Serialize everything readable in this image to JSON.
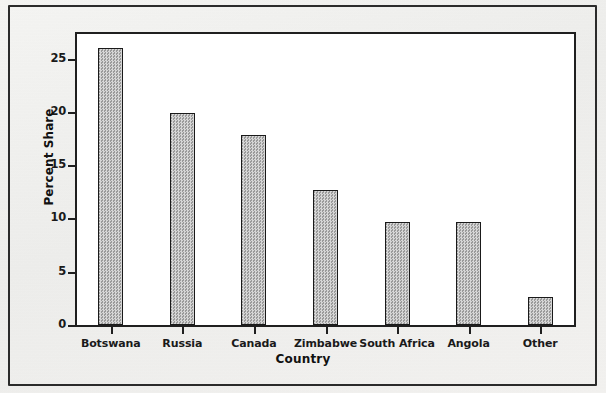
{
  "figure": {
    "has_outer_border": true,
    "background_color": "#f2f2f0",
    "plot_background_color": "#ffffff",
    "bar_fill_color": "#bdbdbd",
    "bar_outline_color": "#1a1a1a",
    "axis_color": "#1f1f1f"
  },
  "chart_data": {
    "type": "bar",
    "title": "",
    "subtitle": "",
    "xlabel": "Country",
    "ylabel": "Percent Share",
    "categories": [
      "Botswana",
      "Russia",
      "Canada",
      "Zimbabwe",
      "South Africa",
      "Angola",
      "Other"
    ],
    "values": [
      26.0,
      19.9,
      17.8,
      12.7,
      9.7,
      9.65,
      2.6
    ],
    "ylim": [
      0,
      27.3
    ],
    "xlim": [
      0,
      7
    ],
    "yticks": [
      0,
      5,
      10,
      15,
      20,
      25
    ],
    "ytick_labels": [
      "0",
      "5",
      "10",
      "15",
      "20",
      "25"
    ],
    "xtick_labels": [
      "Botswana",
      "Russia",
      "Canada",
      "Zimbabwe",
      "South Africa",
      "Angola",
      "Other"
    ],
    "grid": false,
    "legend": null,
    "legend_position": "none",
    "annotations": []
  }
}
